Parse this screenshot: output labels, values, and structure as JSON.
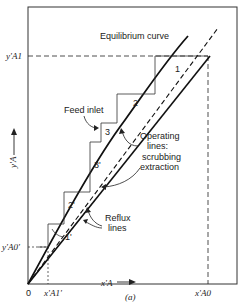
{
  "diagram": {
    "labels": {
      "equilibrium_curve": "Equilibrium curve",
      "feed_inlet": "Feed inlet",
      "operating_lines_1": "Operating",
      "operating_lines_2": "lines:",
      "operating_lines_3": "scrubbing",
      "operating_lines_4": "extraction",
      "reflux_1": "Reflux",
      "reflux_2": "lines",
      "caption": "(a)"
    },
    "axes": {
      "origin": "0",
      "y_axis_label": "y'A",
      "x_axis_label": "x'A",
      "y_tick_top": "y'A1",
      "y_tick_bottom": "y'A0'",
      "x_tick_left": "x'A1'",
      "x_tick_right": "x'A0"
    },
    "stages": [
      "1",
      "2",
      "3",
      "3'",
      "2'",
      "1'"
    ],
    "colors": {
      "line": "#1a1a1a",
      "frame": "#333333",
      "background": "#ffffff"
    }
  }
}
